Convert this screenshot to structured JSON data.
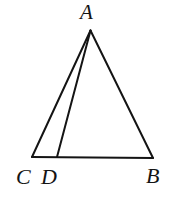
{
  "figure": {
    "kind": "geometry-diagram",
    "background_color": "#ffffff",
    "stroke_color": "#141414",
    "stroke_width": 2,
    "canvas": {
      "width": 179,
      "height": 206
    },
    "points": {
      "A": {
        "label": "A",
        "x": 90.5,
        "y": 30.5
      },
      "C": {
        "label": "C",
        "x": 32,
        "y": 157
      },
      "D": {
        "label": "D",
        "x": 57,
        "y": 157
      },
      "B": {
        "label": "B",
        "x": 153,
        "y": 158
      }
    },
    "segments": [
      {
        "name": "AC",
        "from": "A",
        "to": "C"
      },
      {
        "name": "AD",
        "from": "A",
        "to": "D"
      },
      {
        "name": "AB",
        "from": "A",
        "to": "B"
      },
      {
        "name": "CB",
        "from": "C",
        "to": "B"
      }
    ],
    "labels": {
      "A": "A",
      "C": "C",
      "D": "D",
      "B": "B"
    }
  }
}
